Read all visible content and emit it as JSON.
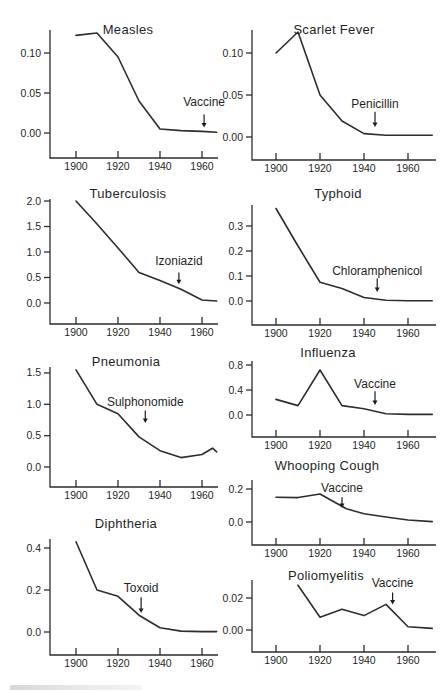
{
  "figure": {
    "background": "#ffffff",
    "ink": "#2d2d2d"
  },
  "chart_data": [
    {
      "id": "measles",
      "type": "line",
      "title": "Measles",
      "x": [
        1900,
        1910,
        1920,
        1930,
        1940,
        1950,
        1960,
        1967
      ],
      "y": [
        0.122,
        0.125,
        0.095,
        0.04,
        0.005,
        0.003,
        0.002,
        0.001
      ],
      "yticks": [
        "0.00",
        "0.05",
        "0.10"
      ],
      "ytick_values": [
        0,
        0.05,
        0.1
      ],
      "xticks": [
        1900,
        1920,
        1940,
        1960
      ],
      "ylim": [
        -0.03,
        0.128
      ],
      "xlim": [
        1888,
        1970
      ],
      "annotation": {
        "label": "Vaccine",
        "year": 1961
      }
    },
    {
      "id": "scarlet-fever",
      "type": "line",
      "title": "Scarlet Fever",
      "x": [
        1900,
        1910,
        1920,
        1930,
        1940,
        1950,
        1960,
        1971
      ],
      "y": [
        0.1,
        0.125,
        0.05,
        0.019,
        0.004,
        0.002,
        0.002,
        0.002
      ],
      "yticks": [
        "0.00",
        "0.05",
        "0.10"
      ],
      "ytick_values": [
        0,
        0.05,
        0.1
      ],
      "xticks": [
        1900,
        1920,
        1940,
        1960
      ],
      "ylim": [
        -0.028,
        0.128
      ],
      "xlim": [
        1889,
        1973
      ],
      "annotation": {
        "label": "Penicillin",
        "year": 1945
      }
    },
    {
      "id": "tuberculosis",
      "type": "line",
      "title": "Tuberculosis",
      "x": [
        1900,
        1910,
        1920,
        1930,
        1940,
        1950,
        1960,
        1967
      ],
      "y": [
        2.0,
        1.55,
        1.08,
        0.6,
        0.44,
        0.27,
        0.06,
        0.04
      ],
      "yticks": [
        "0.0",
        "0.5",
        "1.0",
        "1.5",
        "2.0"
      ],
      "ytick_values": [
        0,
        0.5,
        1.0,
        1.5,
        2.0
      ],
      "xticks": [
        1900,
        1920,
        1940,
        1960
      ],
      "ylim": [
        -0.42,
        2.04
      ],
      "xlim": [
        1888,
        1970
      ],
      "annotation": {
        "label": "Izoniazid",
        "year": 1949
      }
    },
    {
      "id": "typhoid",
      "type": "line",
      "title": "Typhoid",
      "x": [
        1900,
        1910,
        1920,
        1930,
        1940,
        1950,
        1960,
        1971
      ],
      "y": [
        0.37,
        0.22,
        0.075,
        0.05,
        0.014,
        0.003,
        0.001,
        0.001
      ],
      "yticks": [
        "0.0",
        "0.1",
        "0.2",
        "0.3"
      ],
      "ytick_values": [
        0,
        0.1,
        0.2,
        0.3
      ],
      "xticks": [
        1900,
        1920,
        1940,
        1960
      ],
      "ylim": [
        -0.096,
        0.384
      ],
      "xlim": [
        1889,
        1973
      ],
      "annotation": {
        "label": "Chloramphenicol",
        "year": 1946
      }
    },
    {
      "id": "pneumonia",
      "type": "line",
      "title": "Pneumonia",
      "x": [
        1900,
        1910,
        1920,
        1930,
        1940,
        1950,
        1960,
        1965,
        1967
      ],
      "y": [
        1.55,
        1.0,
        0.85,
        0.48,
        0.26,
        0.15,
        0.2,
        0.3,
        0.24
      ],
      "yticks": [
        "0.0",
        "0.5",
        "1.0",
        "1.5"
      ],
      "ytick_values": [
        0,
        0.5,
        1.0,
        1.5
      ],
      "xticks": [
        1900,
        1920,
        1940,
        1960
      ],
      "ylim": [
        -0.32,
        1.6
      ],
      "xlim": [
        1888,
        1970
      ],
      "annotation": {
        "label": "Sulphonomide",
        "year": 1933
      }
    },
    {
      "id": "influenza",
      "type": "line",
      "title": "Influenza",
      "x": [
        1900,
        1910,
        1920,
        1930,
        1940,
        1950,
        1960,
        1971
      ],
      "y": [
        0.25,
        0.15,
        0.72,
        0.15,
        0.1,
        0.02,
        0.01,
        0.01
      ],
      "yticks": [
        "0.0",
        "0.4",
        "0.8"
      ],
      "ytick_values": [
        0,
        0.4,
        0.8
      ],
      "xticks": [
        1900,
        1920,
        1940,
        1960
      ],
      "ylim": [
        -0.35,
        0.86
      ],
      "xlim": [
        1889,
        1973
      ],
      "annotation": {
        "label": "Vaccine",
        "year": 1945
      }
    },
    {
      "id": "whooping-cough",
      "type": "line",
      "title": "Whooping Cough",
      "x": [
        1900,
        1910,
        1920,
        1932,
        1940,
        1950,
        1960,
        1971
      ],
      "y": [
        0.15,
        0.148,
        0.17,
        0.08,
        0.05,
        0.03,
        0.012,
        0.002
      ],
      "yticks": [
        "0.0",
        "0.2"
      ],
      "ytick_values": [
        0,
        0.2
      ],
      "xticks": [
        1900,
        1920,
        1940,
        1960
      ],
      "ylim": [
        -0.14,
        0.255
      ],
      "xlim": [
        1889,
        1973
      ],
      "annotation": {
        "label": "Vaccine",
        "year": 1930
      }
    },
    {
      "id": "diphtheria",
      "type": "line",
      "title": "Diphtheria",
      "x": [
        1900,
        1910,
        1920,
        1930,
        1940,
        1950,
        1960,
        1967
      ],
      "y": [
        0.43,
        0.2,
        0.17,
        0.08,
        0.02,
        0.004,
        0.002,
        0.002
      ],
      "yticks": [
        "0.0",
        "0.2",
        "0.4"
      ],
      "ytick_values": [
        0,
        0.2,
        0.4
      ],
      "xticks": [
        1900,
        1920,
        1940,
        1960
      ],
      "ylim": [
        -0.11,
        0.443
      ],
      "xlim": [
        1888,
        1970
      ],
      "annotation": {
        "label": "Toxoid",
        "year": 1931
      }
    },
    {
      "id": "poliomyelitis",
      "type": "line",
      "title": "Poliomyelitis",
      "x": [
        1910,
        1920,
        1930,
        1940,
        1950,
        1960,
        1971
      ],
      "y": [
        0.028,
        0.008,
        0.013,
        0.009,
        0.016,
        0.002,
        0.001
      ],
      "yticks": [
        "0.00",
        "0.02"
      ],
      "ytick_values": [
        0,
        0.02
      ],
      "xticks": [
        1900,
        1920,
        1940,
        1960
      ],
      "ylim": [
        -0.0137,
        0.0312
      ],
      "xlim": [
        1889,
        1973
      ],
      "annotation": {
        "label": "Vaccine",
        "year": 1953
      }
    }
  ],
  "layout": {
    "canvas": {
      "width": 444,
      "height": 692
    },
    "columns": {
      "left": {
        "x": 0,
        "width": 222,
        "axis_x": 50,
        "x1900": 76,
        "px_per_year": 2.1,
        "plot_right": 218
      },
      "right": {
        "x": 222,
        "width": 222,
        "axis_x": 30,
        "x1900": 54,
        "px_per_year": 2.2,
        "plot_right": 214
      }
    },
    "charts": {
      "measles": {
        "col": "left",
        "top": 6,
        "height": 170,
        "y_zero": 127,
        "px_per_unit": 800,
        "axis_top": 24,
        "baseline": 152,
        "labels_y": 164,
        "title_x": 128,
        "title_y": 28,
        "ann": {
          "label_v": 0.034,
          "from_v": 0.023,
          "to_v": 0.007
        }
      },
      "scarlet-fever": {
        "col": "right",
        "top": 6,
        "height": 170,
        "y_zero": 131,
        "px_per_unit": 840,
        "axis_top": 24,
        "baseline": 154,
        "labels_y": 166,
        "title_x": 112,
        "title_y": 28,
        "ann": {
          "label_v": 0.035,
          "from_v": 0.03,
          "to_v": 0.012
        }
      },
      "tuberculosis": {
        "col": "left",
        "top": 178,
        "height": 166,
        "y_zero": 125,
        "px_per_unit": 51,
        "axis_top": 21,
        "baseline": 146,
        "labels_y": 158,
        "title_x": 128,
        "title_y": 20,
        "ann": {
          "label_v": 0.75,
          "from_v": 0.6,
          "to_v": 0.37
        }
      },
      "typhoid": {
        "col": "right",
        "top": 178,
        "height": 166,
        "y_zero": 123,
        "px_per_unit": 250,
        "axis_top": 27,
        "baseline": 147,
        "labels_y": 159,
        "title_x": 116,
        "title_y": 20,
        "ann": {
          "label_v": 0.105,
          "from_v": 0.09,
          "to_v": 0.036
        }
      },
      "pneumonia": {
        "col": "left",
        "top": 346,
        "height": 160,
        "y_zero": 121,
        "px_per_unit": 62.7,
        "axis_top": 21,
        "baseline": 141,
        "labels_y": 153,
        "title_x": 126,
        "title_y": 20,
        "ann": {
          "label_v": 0.97,
          "from_v": 0.9,
          "to_v": 0.7
        }
      },
      "influenza": {
        "col": "right",
        "top": 341,
        "height": 114,
        "y_zero": 74,
        "px_per_unit": 62.5,
        "axis_top": 20,
        "baseline": 96,
        "labels_y": 108,
        "title_x": 106,
        "title_y": 16,
        "ann": {
          "label_v": 0.43,
          "from_v": 0.38,
          "to_v": 0.16
        }
      },
      "whooping-cough": {
        "col": "right",
        "top": 456,
        "height": 106,
        "y_zero": 66,
        "px_per_unit": 165,
        "axis_top": 24,
        "baseline": 89,
        "labels_y": 101,
        "title_x": 105,
        "title_y": 14,
        "ann": {
          "label_v": 0.18,
          "from_v": 0.15,
          "to_v": 0.085
        }
      },
      "diphtheria": {
        "col": "left",
        "top": 510,
        "height": 172,
        "y_zero": 122,
        "px_per_unit": 210,
        "axis_top": 29,
        "baseline": 145,
        "labels_y": 157,
        "title_x": 126,
        "title_y": 18,
        "ann": {
          "label_v": 0.19,
          "from_v": 0.165,
          "to_v": 0.09
        }
      },
      "poliomyelitis": {
        "col": "right",
        "top": 564,
        "height": 118,
        "y_zero": 66,
        "px_per_unit": 1600,
        "axis_top": 16,
        "baseline": 88,
        "labels_y": 100,
        "title_x": 104,
        "title_y": 16,
        "ann": {
          "label_v": 0.027,
          "from_v": 0.0235,
          "to_v": 0.016
        }
      }
    }
  }
}
